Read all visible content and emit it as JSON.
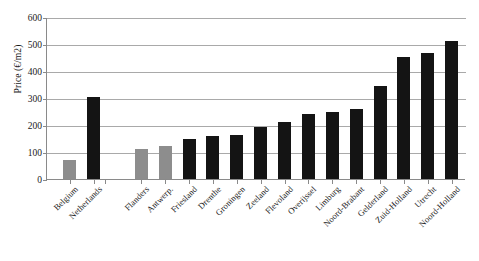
{
  "chart_data": {
    "type": "bar",
    "title": "",
    "subtitle": "",
    "xlabel": "",
    "ylabel": "Price (€/m2)",
    "ylim": [
      0,
      600
    ],
    "yticks": [
      0,
      100,
      200,
      300,
      400,
      500,
      600
    ],
    "grid": true,
    "legend": "none",
    "categories": [
      "Belgium",
      "Netherlands",
      "Flanders",
      "Antwerp.",
      "Friesland",
      "Drenthe",
      "Groningen",
      "Zeeland",
      "Flevoland",
      "Overijssel",
      "Limburg",
      "Noord-Brabant",
      "Gelderland",
      "Zuid-Holland",
      "Utrecht",
      "Noord-Holland"
    ],
    "values": [
      70,
      303,
      112,
      122,
      150,
      158,
      162,
      193,
      212,
      240,
      247,
      260,
      343,
      452,
      468,
      513
    ],
    "bar_colors": [
      "#8d8d8d",
      "#141414",
      "#8d8d8d",
      "#8d8d8d",
      "#141414",
      "#141414",
      "#141414",
      "#141414",
      "#141414",
      "#141414",
      "#141414",
      "#141414",
      "#141414",
      "#141414",
      "#141414",
      "#141414"
    ],
    "series": [
      {
        "name": "Price",
        "values": [
          70,
          303,
          112,
          122,
          150,
          158,
          162,
          193,
          212,
          240,
          247,
          260,
          343,
          452,
          468,
          513
        ]
      }
    ]
  },
  "axis": {
    "y_tick_labels": [
      "0",
      "100",
      "200",
      "300",
      "400",
      "500",
      "600"
    ]
  }
}
